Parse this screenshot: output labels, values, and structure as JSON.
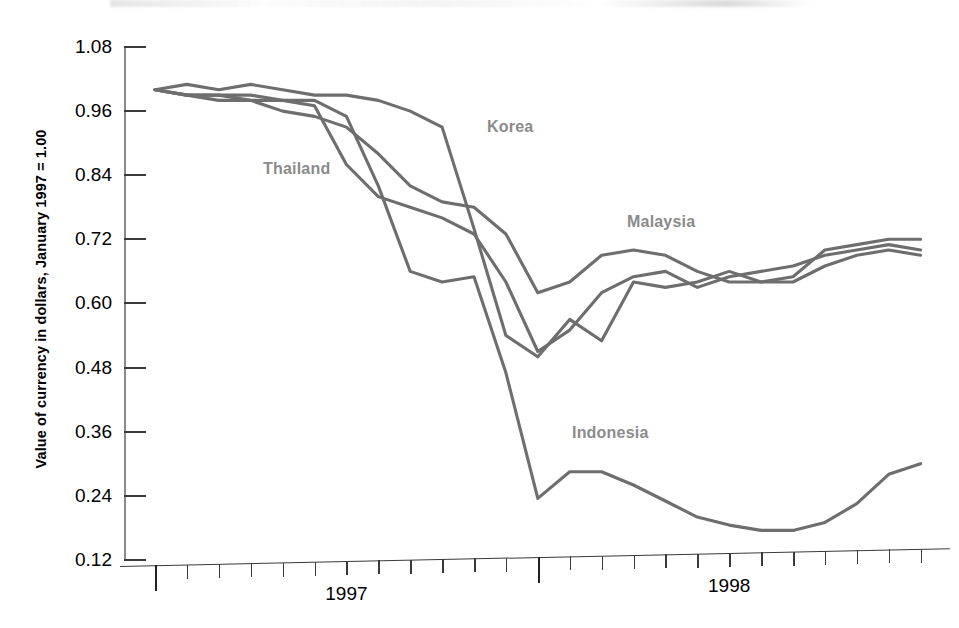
{
  "chart_data": {
    "type": "line",
    "title": "",
    "xlabel": "",
    "ylabel": "Value of currency in dollars, January 1997 = 1.00",
    "ylim": [
      0.12,
      1.08
    ],
    "yticks": [
      "1.08",
      "0.96",
      "0.84",
      "0.72",
      "0.60",
      "0.48",
      "0.36",
      "0.24",
      "0.12"
    ],
    "ytick_values": [
      1.08,
      0.96,
      0.84,
      0.72,
      0.6,
      0.48,
      0.36,
      0.24,
      0.12
    ],
    "xtick_labels": [
      "1997",
      "1998"
    ],
    "x_axis_note": "monthly ticks; major ticks mark start of 1997 and start of 1998",
    "grid": false,
    "legend": "inline-labels",
    "x": [
      "1997-01",
      "1997-02",
      "1997-03",
      "1997-04",
      "1997-05",
      "1997-06",
      "1997-07",
      "1997-08",
      "1997-09",
      "1997-10",
      "1997-11",
      "1997-12",
      "1998-01",
      "1998-02",
      "1998-03",
      "1998-04",
      "1998-05",
      "1998-06",
      "1998-07",
      "1998-08",
      "1998-09",
      "1998-10",
      "1998-11",
      "1998-12",
      "1999-01"
    ],
    "series": [
      {
        "name": "Korea",
        "label_position": "upper-middle",
        "values": [
          1.0,
          1.01,
          1.0,
          1.01,
          1.0,
          0.99,
          0.99,
          0.98,
          0.96,
          0.93,
          0.74,
          0.54,
          0.5,
          0.57,
          0.53,
          0.64,
          0.63,
          0.64,
          0.66,
          0.64,
          0.65,
          0.7,
          0.71,
          0.72,
          0.72
        ]
      },
      {
        "name": "Thailand",
        "label_position": "left-middle",
        "values": [
          1.0,
          0.99,
          0.98,
          0.98,
          0.98,
          0.97,
          0.86,
          0.8,
          0.78,
          0.76,
          0.73,
          0.64,
          0.51,
          0.55,
          0.62,
          0.65,
          0.66,
          0.63,
          0.65,
          0.66,
          0.67,
          0.69,
          0.7,
          0.71,
          0.7
        ]
      },
      {
        "name": "Malaysia",
        "label_position": "right-upper",
        "values": [
          1.0,
          0.99,
          0.99,
          0.98,
          0.96,
          0.95,
          0.93,
          0.88,
          0.82,
          0.79,
          0.78,
          0.73,
          0.62,
          0.64,
          0.69,
          0.7,
          0.69,
          0.66,
          0.64,
          0.64,
          0.64,
          0.67,
          0.69,
          0.7,
          0.69
        ]
      },
      {
        "name": "Indonesia",
        "label_position": "lower-middle",
        "values": [
          1.0,
          0.99,
          0.99,
          0.99,
          0.98,
          0.98,
          0.95,
          0.82,
          0.66,
          0.64,
          0.65,
          0.47,
          0.235,
          0.285,
          0.285,
          0.26,
          0.23,
          0.2,
          0.185,
          0.175,
          0.175,
          0.19,
          0.225,
          0.28,
          0.3
        ]
      }
    ]
  },
  "labels": {
    "korea": "Korea",
    "thailand": "Thailand",
    "malaysia": "Malaysia",
    "indonesia": "Indonesia"
  },
  "colors": {
    "line": "#6e6e6e",
    "series_label": "#8b8b8b",
    "axis": "#3a3a3a",
    "text": "#000000",
    "background": "#ffffff"
  }
}
